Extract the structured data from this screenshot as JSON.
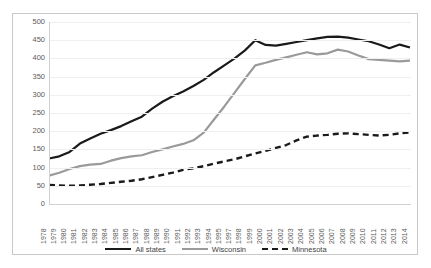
{
  "chart_data": {
    "type": "line",
    "title": "",
    "subtitle": "",
    "xlabel": "",
    "ylabel": "",
    "ylim": [
      0,
      500
    ],
    "ytick_labels": [
      "500",
      "450",
      "400",
      "350",
      "300",
      "250",
      "200",
      "150",
      "100",
      "50",
      "0"
    ],
    "yticks": [
      500,
      450,
      400,
      350,
      300,
      250,
      200,
      150,
      100,
      50,
      0
    ],
    "grid": true,
    "legend_position": "bottom",
    "categories": [
      "1978",
      "1979",
      "1980",
      "1981",
      "1982",
      "1983",
      "1984",
      "1985",
      "1986",
      "1987",
      "1988",
      "1989",
      "1990",
      "1991",
      "1992",
      "1993",
      "1994",
      "1995",
      "1997",
      "1998",
      "1999",
      "2000",
      "2001",
      "2002",
      "2003",
      "2004",
      "2005",
      "2006",
      "2007",
      "2008",
      "2009",
      "2010",
      "2011",
      "2012",
      "2013",
      "2014"
    ],
    "series": [
      {
        "name": "All states",
        "color": "#1a1a1a",
        "style": "solid",
        "width": 2.2,
        "values": [
          125,
          131,
          143,
          166,
          180,
          193,
          203,
          214,
          227,
          240,
          262,
          281,
          296,
          309,
          324,
          341,
          362,
          381,
          400,
          422,
          450,
          437,
          435,
          440,
          445,
          450,
          455,
          459,
          460,
          457,
          452,
          447,
          438,
          428,
          438,
          430
        ]
      },
      {
        "name": "Wisconsin",
        "color": "#9a9a9a",
        "style": "solid",
        "width": 2.2,
        "values": [
          78,
          86,
          96,
          104,
          108,
          110,
          119,
          126,
          131,
          134,
          143,
          150,
          158,
          165,
          175,
          196,
          232,
          268,
          306,
          344,
          381,
          388,
          396,
          403,
          410,
          417,
          411,
          414,
          424,
          419,
          408,
          398,
          396,
          394,
          392,
          394
        ]
      },
      {
        "name": "Minnesota",
        "color": "#1a1a1a",
        "style": "dashed",
        "width": 2.4,
        "values": [
          52,
          51,
          50,
          51,
          53,
          55,
          58,
          61,
          64,
          68,
          74,
          80,
          86,
          94,
          98,
          104,
          111,
          117,
          123,
          131,
          139,
          146,
          154,
          162,
          175,
          185,
          188,
          190,
          193,
          194,
          192,
          190,
          188,
          190,
          194,
          197
        ]
      }
    ]
  },
  "axes": {
    "y_label_color": "#5a5a5a",
    "x_label_color": "#5a5a5a",
    "gridline_color": "#efefef",
    "axis_color": "#d0d0d0"
  },
  "legend": {
    "items": [
      {
        "label": "All states",
        "color": "#1a1a1a",
        "style": "solid"
      },
      {
        "label": "Wisconsin",
        "color": "#9a9a9a",
        "style": "solid"
      },
      {
        "label": "Minnesota",
        "color": "#1a1a1a",
        "style": "dashed"
      }
    ]
  },
  "frame": {
    "border_color": "#c9c9c9",
    "background": "#ffffff"
  }
}
